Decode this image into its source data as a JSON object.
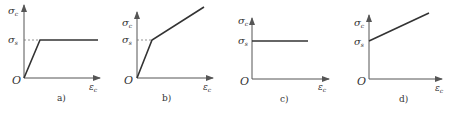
{
  "figure": {
    "panels": [
      {
        "id": "a",
        "caption": "a)",
        "y_label": "σ",
        "y_sub": "c",
        "level_label": "σ",
        "level_sub": "s",
        "x_label": "ε",
        "x_sub": "c",
        "origin": "O",
        "model": "elastic-perfectly-plastic"
      },
      {
        "id": "b",
        "caption": "b)",
        "y_label": "σ",
        "y_sub": "c",
        "level_label": "σ",
        "level_sub": "s",
        "x_label": "ε",
        "x_sub": "c",
        "origin": "O",
        "model": "bilinear-hardening"
      },
      {
        "id": "c",
        "caption": "c)",
        "y_label": "σ",
        "y_sub": "c",
        "level_label": "σ",
        "level_sub": "s",
        "x_label": "ε",
        "x_sub": "c",
        "origin": "O",
        "model": "rigid-perfectly-plastic"
      },
      {
        "id": "d",
        "caption": "d)",
        "y_label": "σ",
        "y_sub": "c",
        "level_label": "σ",
        "level_sub": "s",
        "x_label": "ε",
        "x_sub": "c",
        "origin": "O",
        "model": "rigid-linear-hardening"
      }
    ],
    "colors": {
      "line": "#333333",
      "axis": "#555555",
      "dash": "#777777"
    }
  }
}
